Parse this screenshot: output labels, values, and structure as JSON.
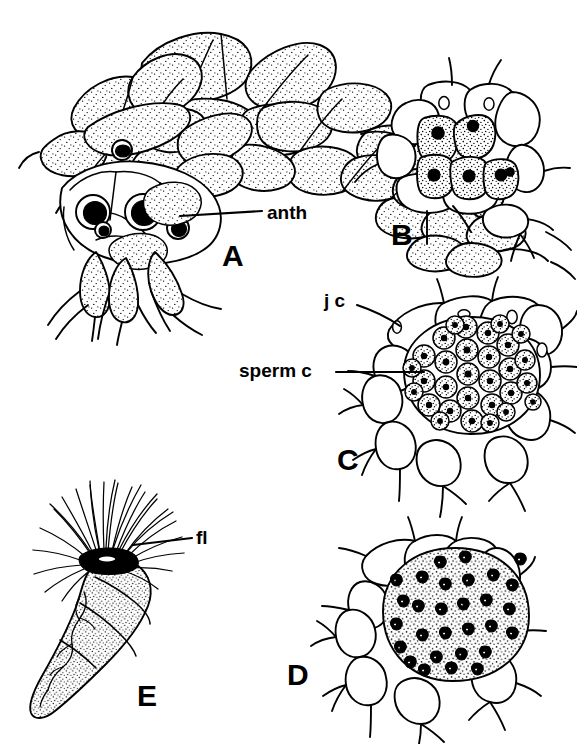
{
  "figure": {
    "type": "scientific-line-drawing-plate",
    "background_color": "#ffffff",
    "ink_color": "#000000",
    "width": 577,
    "height": 744,
    "panel_count": 5
  },
  "panels": [
    {
      "id": "A",
      "letter": "A",
      "subject": "branched filamentous thallus bearing antheridia",
      "description": "Whole mount of a branched filament with fan-like tiers of elongate stippled cells and several dark spherical antheridia borne near the base",
      "letter_x": 222,
      "letter_y": 241
    },
    {
      "id": "B",
      "letter": "B",
      "subject": "young antheridium with few sperm mother cells",
      "description": "Early-stage antheridium enclosed by jacket cells, containing five stippled sperm mother cells each with a dark nucleus",
      "letter_x": 391,
      "letter_y": 220
    },
    {
      "id": "C",
      "letter": "C",
      "subject": "mature antheridium packed with sperm cells",
      "description": "Antheridium surrounded by jacket cells, filled with numerous small polygonal stippled sperm cells each with a dark nucleus",
      "letter_x": 337,
      "letter_y": 445
    },
    {
      "id": "D",
      "letter": "D",
      "subject": "antheridium with differentiated spermatozoids",
      "description": "Antheridium whose contents have matured into comma-shaped dark spermatozoids scattered in a finely stippled matrix",
      "letter_x": 287,
      "letter_y": 660
    },
    {
      "id": "E",
      "letter": "E",
      "subject": "released multiflagellate spermatozoid",
      "description": "Single pear-shaped spermatozoid with a coiled stippled body and a dense apical tuft of numerous long flagella",
      "letter_x": 137,
      "letter_y": 681
    }
  ],
  "callouts": [
    {
      "id": "anth",
      "label": "anth",
      "meaning": "antheridium",
      "panel": "A",
      "label_x": 267,
      "label_y": 203,
      "leader": {
        "x1": 180,
        "y1": 216,
        "x2": 262,
        "y2": 211
      }
    },
    {
      "id": "jc",
      "label": "j c",
      "meaning": "jacket cell",
      "panel": "C",
      "label_x": 324,
      "label_y": 291,
      "leader": {
        "x1": 357,
        "y1": 305,
        "x2": 400,
        "y2": 325
      }
    },
    {
      "id": "sperm-c",
      "label": "sperm c",
      "meaning": "sperm cell",
      "panel": "C",
      "label_x": 239,
      "label_y": 361,
      "leader": {
        "x1": 336,
        "y1": 372,
        "x2": 420,
        "y2": 372
      }
    },
    {
      "id": "fl",
      "label": "fl",
      "meaning": "flagella",
      "panel": "E",
      "label_x": 196,
      "label_y": 528,
      "leader": {
        "x1": 133,
        "y1": 545,
        "x2": 192,
        "y2": 538
      }
    }
  ],
  "style_notes": {
    "line_art": "black ink outline on white, stippled cell interiors",
    "panel_letter_weight": "bold",
    "label_weight": "bold"
  }
}
